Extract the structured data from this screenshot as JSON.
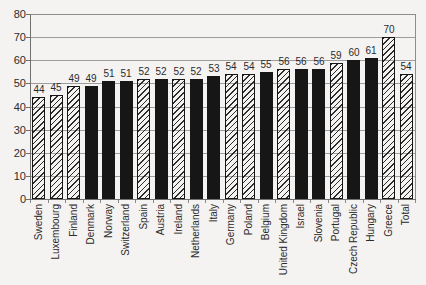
{
  "chart_data": {
    "type": "bar",
    "title": "",
    "xlabel": "",
    "ylabel": "",
    "ylim": [
      0,
      80
    ],
    "yticks": [
      0,
      10,
      20,
      30,
      40,
      50,
      60,
      70,
      80
    ],
    "grid": true,
    "legend": null,
    "value_labels_shown": true,
    "categories": [
      "Sweden",
      "Luxembourg",
      "Finland",
      "Denmark",
      "Norway",
      "Switzerland",
      "Spain",
      "Austria",
      "Ireland",
      "Netherlands",
      "Italy",
      "Germany",
      "Poland",
      "Belgium",
      "United Kingdom",
      "Israel",
      "Slovenia",
      "Portugal",
      "Czech Republic",
      "Hungary",
      "Greece",
      "Total"
    ],
    "values": [
      44,
      45,
      49,
      49,
      51,
      51,
      52,
      52,
      52,
      52,
      53,
      54,
      54,
      55,
      56,
      56,
      56,
      59,
      60,
      61,
      70,
      54
    ],
    "bar_styles": [
      "hatched",
      "hatched",
      "hatched",
      "black",
      "black",
      "black",
      "hatched",
      "black",
      "hatched",
      "black",
      "black",
      "hatched",
      "hatched",
      "black",
      "hatched",
      "black",
      "black",
      "hatched",
      "black",
      "black",
      "hatched",
      "hatched"
    ],
    "colors": {
      "solid_bar": "#161616",
      "hatch_line": "#1c1c1c",
      "gridline": "#9d9d9d",
      "axis": "#707070",
      "text": "#2b2b2b",
      "background": "#f4f3f1"
    }
  }
}
